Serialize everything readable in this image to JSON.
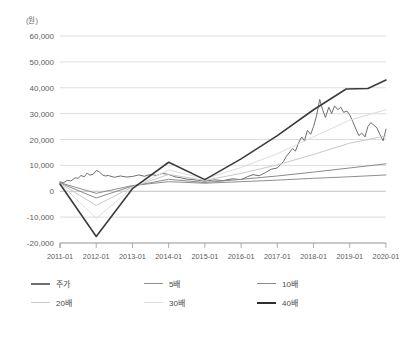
{
  "chart_data": {
    "type": "line",
    "title": "",
    "subtitle": "",
    "xlabel": "",
    "ylabel": "",
    "unit_label": "(원)",
    "grid": true,
    "legend_position": "bottom",
    "ylim": [
      -20000,
      60000
    ],
    "yticks": [
      60000,
      50000,
      40000,
      30000,
      20000,
      10000,
      0,
      -10000,
      -20000
    ],
    "ytick_labels": [
      "60,000",
      "50,000",
      "40,000",
      "30,000",
      "20,000",
      "10,000",
      "0",
      "-10,000",
      "-20,000"
    ],
    "x": [
      "2011-01",
      "2012-01",
      "2013-01",
      "2014-01",
      "2015-01",
      "2016-01",
      "2017-01",
      "2018-01",
      "2019-01",
      "2020-01"
    ],
    "xtick_labels": [
      "2011-01",
      "2012-01",
      "2013-01",
      "2014-01",
      "2015-01",
      "2016-01",
      "2017-01",
      "2018-01",
      "2019-01",
      "2020-01"
    ],
    "series": [
      {
        "name": "주가",
        "color": "#6e6e6e",
        "width": 1.0,
        "points": [
          [
            2011.0,
            3600
          ],
          [
            2011.1,
            3300
          ],
          [
            2011.2,
            4200
          ],
          [
            2011.3,
            4000
          ],
          [
            2011.42,
            5200
          ],
          [
            2011.5,
            5000
          ],
          [
            2011.58,
            6100
          ],
          [
            2011.67,
            5600
          ],
          [
            2011.75,
            7000
          ],
          [
            2011.83,
            6200
          ],
          [
            2011.92,
            6600
          ],
          [
            2012.0,
            8000
          ],
          [
            2012.08,
            7600
          ],
          [
            2012.17,
            6300
          ],
          [
            2012.25,
            5900
          ],
          [
            2012.33,
            6100
          ],
          [
            2012.5,
            5400
          ],
          [
            2012.67,
            5900
          ],
          [
            2012.83,
            5500
          ],
          [
            2013.0,
            5700
          ],
          [
            2013.17,
            6300
          ],
          [
            2013.33,
            5800
          ],
          [
            2013.5,
            6500
          ],
          [
            2013.67,
            6100
          ],
          [
            2013.83,
            6900
          ],
          [
            2014.0,
            6500
          ],
          [
            2014.17,
            5600
          ],
          [
            2014.33,
            5200
          ],
          [
            2014.5,
            4700
          ],
          [
            2014.67,
            4500
          ],
          [
            2014.83,
            4200
          ],
          [
            2015.0,
            3900
          ],
          [
            2015.25,
            4400
          ],
          [
            2015.5,
            4100
          ],
          [
            2015.75,
            4800
          ],
          [
            2016.0,
            4500
          ],
          [
            2016.17,
            5600
          ],
          [
            2016.33,
            6400
          ],
          [
            2016.5,
            6000
          ],
          [
            2016.67,
            7200
          ],
          [
            2016.83,
            8500
          ],
          [
            2017.0,
            9000
          ],
          [
            2017.17,
            11500
          ],
          [
            2017.25,
            13500
          ],
          [
            2017.42,
            16500
          ],
          [
            2017.5,
            15500
          ],
          [
            2017.58,
            18500
          ],
          [
            2017.67,
            21000
          ],
          [
            2017.75,
            19500
          ],
          [
            2017.83,
            23500
          ],
          [
            2017.92,
            22000
          ],
          [
            2018.0,
            25000
          ],
          [
            2018.08,
            29000
          ],
          [
            2018.17,
            35500
          ],
          [
            2018.25,
            31500
          ],
          [
            2018.33,
            28500
          ],
          [
            2018.42,
            32500
          ],
          [
            2018.5,
            30000
          ],
          [
            2018.58,
            33000
          ],
          [
            2018.67,
            31500
          ],
          [
            2018.75,
            32500
          ],
          [
            2018.83,
            30500
          ],
          [
            2018.92,
            31000
          ],
          [
            2019.0,
            29500
          ],
          [
            2019.08,
            27000
          ],
          [
            2019.17,
            24000
          ],
          [
            2019.25,
            21500
          ],
          [
            2019.33,
            22500
          ],
          [
            2019.42,
            21000
          ],
          [
            2019.5,
            25000
          ],
          [
            2019.58,
            26500
          ],
          [
            2019.67,
            25500
          ],
          [
            2019.75,
            24500
          ],
          [
            2019.83,
            22000
          ],
          [
            2019.92,
            19500
          ],
          [
            2020.0,
            24000
          ]
        ]
      },
      {
        "name": "5배",
        "color": "#8f8f8f",
        "width": 1.0,
        "points": [
          [
            2011.0,
            3300
          ],
          [
            2012.0,
            -800
          ],
          [
            2013.0,
            2200
          ],
          [
            2014.0,
            3700
          ],
          [
            2015.0,
            3100
          ],
          [
            2016.0,
            3700
          ],
          [
            2017.0,
            4300
          ],
          [
            2018.0,
            5000
          ],
          [
            2019.0,
            5600
          ],
          [
            2020.0,
            6300
          ]
        ]
      },
      {
        "name": "10배",
        "color": "#8a8a8a",
        "width": 1.0,
        "points": [
          [
            2011.0,
            3200
          ],
          [
            2012.0,
            -2600
          ],
          [
            2013.0,
            2000
          ],
          [
            2014.0,
            4600
          ],
          [
            2015.0,
            3400
          ],
          [
            2016.0,
            4600
          ],
          [
            2017.0,
            5900
          ],
          [
            2018.0,
            7400
          ],
          [
            2019.0,
            9000
          ],
          [
            2020.0,
            10600
          ]
        ]
      },
      {
        "name": "20배",
        "color": "#c9c9c9",
        "width": 1.0,
        "points": [
          [
            2011.0,
            3100
          ],
          [
            2012.0,
            -5500
          ],
          [
            2013.0,
            1700
          ],
          [
            2014.0,
            6500
          ],
          [
            2015.0,
            4200
          ],
          [
            2016.0,
            6900
          ],
          [
            2017.0,
            10200
          ],
          [
            2018.0,
            14200
          ],
          [
            2019.0,
            18600
          ],
          [
            2020.0,
            21400
          ]
        ]
      },
      {
        "name": "30배",
        "color": "#dddddd",
        "width": 1.0,
        "points": [
          [
            2011.0,
            3000
          ],
          [
            2012.0,
            -10500
          ],
          [
            2013.0,
            1400
          ],
          [
            2014.0,
            8200
          ],
          [
            2015.0,
            4800
          ],
          [
            2016.0,
            9200
          ],
          [
            2017.0,
            14500
          ],
          [
            2018.0,
            21000
          ],
          [
            2019.0,
            27500
          ],
          [
            2020.0,
            31500
          ]
        ]
      },
      {
        "name": "40배",
        "color": "#3c3c3c",
        "width": 1.6,
        "points": [
          [
            2011.0,
            2800
          ],
          [
            2012.0,
            -17500
          ],
          [
            2013.0,
            1000
          ],
          [
            2014.0,
            11200
          ],
          [
            2015.0,
            4500
          ],
          [
            2016.0,
            12500
          ],
          [
            2017.0,
            21500
          ],
          [
            2018.0,
            31500
          ],
          [
            2018.9,
            39500
          ],
          [
            2019.5,
            39700
          ],
          [
            2020.0,
            43000
          ]
        ]
      }
    ],
    "legend": [
      {
        "label": "주가",
        "color": "#6e6e6e",
        "width": 2.4
      },
      {
        "label": "5배",
        "color": "#8f8f8f",
        "width": 1.8
      },
      {
        "label": "10배",
        "color": "#8a8a8a",
        "width": 1.8
      },
      {
        "label": "20배",
        "color": "#c9c9c9",
        "width": 1.8
      },
      {
        "label": "30배",
        "color": "#dddddd",
        "width": 1.8
      },
      {
        "label": "40배",
        "color": "#2e2e2e",
        "width": 2.6
      }
    ]
  }
}
